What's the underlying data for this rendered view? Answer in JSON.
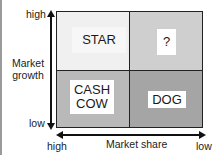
{
  "diagram": {
    "type": "BCG growth-share matrix",
    "y_axis": {
      "title": "Market\ngrowth",
      "high_label": "high",
      "low_label": "low"
    },
    "x_axis": {
      "title": "Market share",
      "high_label": "high",
      "low_label": "low"
    },
    "quadrants": [
      {
        "position": "top-left",
        "label": "STAR",
        "color": "#f0f0f0"
      },
      {
        "position": "top-right",
        "label": "?",
        "color": "#cfcfcf"
      },
      {
        "position": "bottom-left",
        "label": "CASH\nCOW",
        "color": "#b9b9b9"
      },
      {
        "position": "bottom-right",
        "label": "DOG",
        "color": "#a5a5a5"
      }
    ],
    "colors": {
      "grid_line": "#222222",
      "arrow": "#111111",
      "label_bg": "#ffffff"
    }
  }
}
